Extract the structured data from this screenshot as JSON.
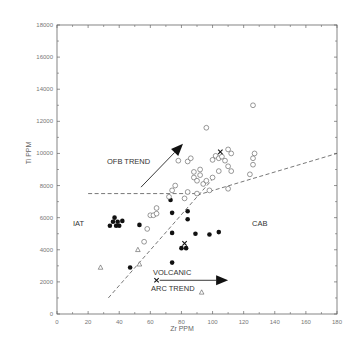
{
  "chart_data": {
    "type": "scatter",
    "title": "",
    "xlabel": "Zr PPM",
    "ylabel": "Ti PPM",
    "xlim": [
      0,
      180
    ],
    "ylim": [
      0,
      18000
    ],
    "x_ticks": [
      0,
      20,
      40,
      60,
      80,
      100,
      120,
      140,
      160,
      180
    ],
    "y_ticks": [
      0,
      2000,
      4000,
      6000,
      8000,
      10000,
      12000,
      14000,
      16000,
      18000
    ],
    "grid": false,
    "series": [
      {
        "name": "filled-circles",
        "marker": "filled-circle",
        "points": [
          [
            34,
            5500
          ],
          [
            36,
            5750
          ],
          [
            37,
            6000
          ],
          [
            38,
            5500
          ],
          [
            39,
            5750
          ],
          [
            40,
            5500
          ],
          [
            42,
            5800
          ],
          [
            53,
            5550
          ],
          [
            47,
            2900
          ],
          [
            73,
            7100
          ],
          [
            74,
            6300
          ],
          [
            84,
            6400
          ],
          [
            84,
            5900
          ],
          [
            74,
            5050
          ],
          [
            89,
            5000
          ],
          [
            98,
            4950
          ],
          [
            104,
            5100
          ],
          [
            80,
            4100
          ],
          [
            83,
            4100
          ],
          [
            74,
            3200
          ]
        ]
      },
      {
        "name": "open-circles",
        "marker": "open-circle",
        "points": [
          [
            56,
            4500
          ],
          [
            58,
            5300
          ],
          [
            60,
            6150
          ],
          [
            62,
            6150
          ],
          [
            64,
            6250
          ],
          [
            64,
            6600
          ],
          [
            72,
            7300
          ],
          [
            74,
            7700
          ],
          [
            76,
            8000
          ],
          [
            78,
            9550
          ],
          [
            84,
            9500
          ],
          [
            86,
            9700
          ],
          [
            88,
            8500
          ],
          [
            88,
            8850
          ],
          [
            90,
            8300
          ],
          [
            92,
            8650
          ],
          [
            92,
            9000
          ],
          [
            94,
            8100
          ],
          [
            96,
            8300
          ],
          [
            84,
            7600
          ],
          [
            82,
            7200
          ],
          [
            90,
            7500
          ],
          [
            98,
            7700
          ],
          [
            100,
            9600
          ],
          [
            102,
            9850
          ],
          [
            104,
            9700
          ],
          [
            106,
            9800
          ],
          [
            108,
            9550
          ],
          [
            110,
            9200
          ],
          [
            110,
            10250
          ],
          [
            112,
            10000
          ],
          [
            112,
            8900
          ],
          [
            110,
            7800
          ],
          [
            100,
            8500
          ],
          [
            104,
            8900
          ],
          [
            96,
            11600
          ],
          [
            126,
            13000
          ],
          [
            127,
            10000
          ],
          [
            126,
            9700
          ],
          [
            126,
            9300
          ],
          [
            124,
            8700
          ]
        ]
      },
      {
        "name": "open-triangles",
        "marker": "open-triangle",
        "points": [
          [
            28,
            2900
          ],
          [
            52,
            4000
          ],
          [
            53,
            3100
          ],
          [
            93,
            1350
          ]
        ]
      },
      {
        "name": "crosses",
        "marker": "cross",
        "points": [
          [
            82,
            4400
          ],
          [
            64,
            2100
          ],
          [
            105,
            10100
          ]
        ]
      }
    ],
    "lines": [
      {
        "name": "OFB boundary (horizontal dashed)",
        "style": "dashed",
        "points": [
          [
            20,
            7500
          ],
          [
            90,
            7500
          ]
        ]
      },
      {
        "name": "CAB boundary (rising dashed)",
        "style": "dashed",
        "points": [
          [
            90,
            7400
          ],
          [
            180,
            10000
          ]
        ]
      },
      {
        "name": "IAT boundary (steep dashed)",
        "style": "dashed",
        "points": [
          [
            33,
            1000
          ],
          [
            100,
            8400
          ]
        ]
      }
    ],
    "arrows": [
      {
        "name": "OFB trend arrow",
        "from": [
          54,
          7900
        ],
        "to": [
          81,
          10600
        ]
      },
      {
        "name": "Volcanic arc trend arrow",
        "from": [
          66,
          2100
        ],
        "to": [
          110,
          2100
        ]
      }
    ],
    "annotations": [
      {
        "text": "OFB TREND",
        "x": 42,
        "y": 9300
      },
      {
        "text": "IAT",
        "x": 10,
        "y": 5500
      },
      {
        "text": "CAB",
        "x": 117,
        "y": 5500
      },
      {
        "text": "VOLCANIC",
        "x": 60,
        "y": 2500
      },
      {
        "text": "ARC TREND",
        "x": 59,
        "y": 1500
      }
    ]
  },
  "labels": {
    "xlabel": "Zr PPM",
    "ylabel": "Ti PPM",
    "ofb": "OFB TREND",
    "iat": "IAT",
    "cab": "CAB",
    "volcanic": "VOLCANIC",
    "arc": "ARC TREND"
  }
}
